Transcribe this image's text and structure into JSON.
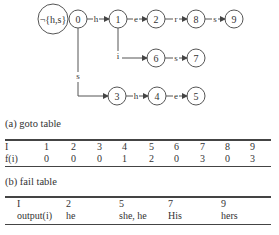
{
  "diagram": {
    "root_label": "¬{h,s}",
    "nodes": [
      {
        "id": "0",
        "label": "0"
      },
      {
        "id": "1",
        "label": "1"
      },
      {
        "id": "2",
        "label": "2"
      },
      {
        "id": "8",
        "label": "8"
      },
      {
        "id": "9",
        "label": "9"
      },
      {
        "id": "6",
        "label": "6"
      },
      {
        "id": "7",
        "label": "7"
      },
      {
        "id": "3",
        "label": "3"
      },
      {
        "id": "4",
        "label": "4"
      },
      {
        "id": "5",
        "label": "5"
      }
    ],
    "edges": [
      {
        "from": "0",
        "to": "1",
        "label": "h"
      },
      {
        "from": "1",
        "to": "2",
        "label": "e"
      },
      {
        "from": "2",
        "to": "8",
        "label": "r"
      },
      {
        "from": "8",
        "to": "9",
        "label": "s"
      },
      {
        "from": "1",
        "to": "6",
        "label": "i"
      },
      {
        "from": "6",
        "to": "7",
        "label": "s"
      },
      {
        "from": "0",
        "to": "3",
        "label": "s"
      },
      {
        "from": "3",
        "to": "4",
        "label": "h"
      },
      {
        "from": "4",
        "to": "5",
        "label": "e"
      }
    ]
  },
  "goto_table": {
    "caption": "(a) goto table",
    "header": [
      "I",
      "1",
      "2",
      "3",
      "4",
      "5",
      "6",
      "7",
      "8",
      "9"
    ],
    "row": [
      "f(i)",
      "0",
      "0",
      "0",
      "1",
      "2",
      "0",
      "3",
      "0",
      "3"
    ]
  },
  "fail_table": {
    "caption": "(b) fail table",
    "header": [
      "I",
      "2",
      "5",
      "7",
      "9"
    ],
    "row": [
      "output(i)",
      "he",
      "she, he",
      "His",
      "hers"
    ]
  }
}
